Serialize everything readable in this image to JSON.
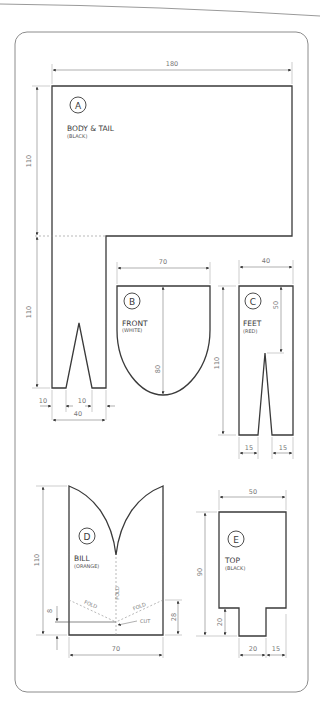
{
  "pieces": {
    "A": {
      "letter": "A",
      "name": "BODY & TAIL",
      "color": "(BLACK)"
    },
    "B": {
      "letter": "B",
      "name": "FRONT",
      "color": "(WHITE)"
    },
    "C": {
      "letter": "C",
      "name": "FEET",
      "color": "(RED)"
    },
    "D": {
      "letter": "D",
      "name": "BILL",
      "color": "(ORANGE)"
    },
    "E": {
      "letter": "E",
      "name": "TOP",
      "color": "(BLACK)"
    }
  },
  "dimensions": {
    "a_width": "180",
    "a_height_top": "110",
    "a_height_leg": "110",
    "a_leg_left": "10",
    "a_leg_notch": "10",
    "a_leg_width": "40",
    "b_width": "70",
    "b_height": "80",
    "b_side": "110",
    "c_width": "40",
    "c_notch_depth": "50",
    "c_foot_left": "15",
    "c_foot_right": "15",
    "d_height": "110",
    "d_cut": "8",
    "d_fold_height": "28",
    "d_width": "70",
    "e_width": "50",
    "e_height": "90",
    "e_tab_height": "20",
    "e_tab_width": "20",
    "e_tab_offset": "15"
  },
  "annotations": {
    "fold": "FOLD",
    "cut": "CUT"
  },
  "colors": {
    "outline": "#3a3a3a",
    "dimension": "#7a7a7a",
    "frame": "#8c8c8c"
  }
}
